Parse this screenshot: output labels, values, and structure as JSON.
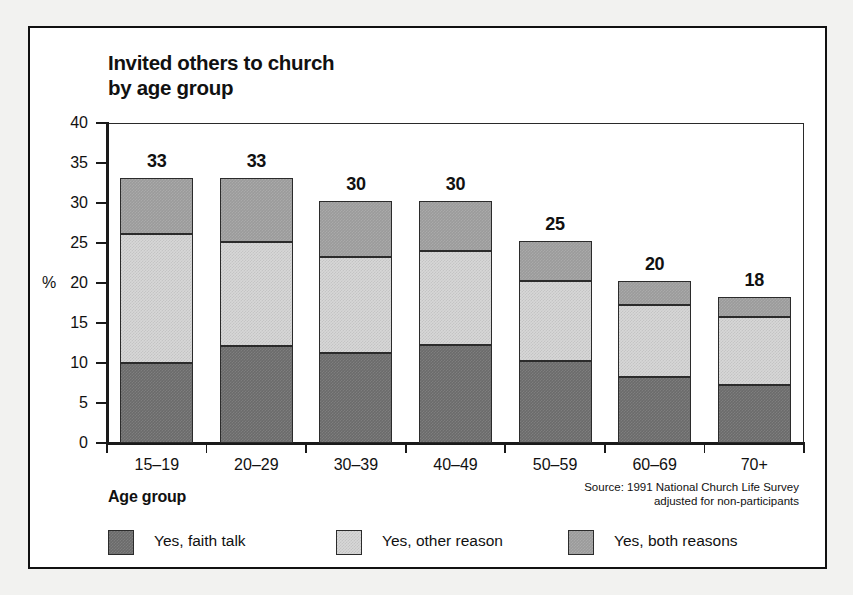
{
  "figure": {
    "title": "Invited others to church\nby age group",
    "axis_title": "Age group",
    "source": "Source: 1991 National Church Life Survey\nadjusted for non-participants",
    "percent_symbol": "%"
  },
  "legend": {
    "items": [
      {
        "label": "Yes, faith talk",
        "key": "faith",
        "color": "#6b6b6b",
        "swatch_name": "legend-swatch-faith-talk"
      },
      {
        "label": "Yes, other reason",
        "key": "other",
        "color": "#d7d7d7",
        "swatch_name": "legend-swatch-other-reason"
      },
      {
        "label": "Yes, both reasons",
        "key": "both",
        "color": "#9b9b9b",
        "swatch_name": "legend-swatch-both-reasons"
      }
    ]
  },
  "chart_data": {
    "type": "bar",
    "subtype": "stacked-vertical",
    "title": "Invited others to church by age group",
    "xlabel": "Age group",
    "ylabel": "%",
    "ylim": [
      0,
      40
    ],
    "yticks": [
      0,
      5,
      10,
      15,
      20,
      25,
      30,
      35,
      40
    ],
    "ytick_labels": [
      "0",
      "5",
      "10",
      "15",
      "20",
      "25",
      "30",
      "35",
      "40"
    ],
    "grid": false,
    "legend_position": "bottom",
    "categories": [
      "15–19",
      "20–29",
      "30–39",
      "40–49",
      "50–59",
      "60–69",
      "70+"
    ],
    "series": [
      {
        "name": "Yes, faith talk",
        "color": "#6b6b6b",
        "values": [
          10.0,
          12.1,
          11.2,
          12.2,
          10.2,
          8.2,
          7.2
        ]
      },
      {
        "name": "Yes, other reason",
        "color": "#d7d7d7",
        "values": [
          16.1,
          13.0,
          12.0,
          11.8,
          10.0,
          9.0,
          8.5
        ]
      },
      {
        "name": "Yes, both reasons",
        "color": "#9b9b9b",
        "values": [
          7.0,
          8.0,
          7.0,
          6.2,
          5.1,
          3.1,
          2.6
        ]
      }
    ],
    "totals": [
      33.1,
      33.1,
      30.2,
      30.2,
      25.3,
      20.3,
      18.3
    ],
    "total_labels": [
      "33",
      "33",
      "30",
      "30",
      "25",
      "20",
      "18"
    ],
    "annotation": "Source: 1991 National Church Life Survey adjusted for non-participants"
  }
}
